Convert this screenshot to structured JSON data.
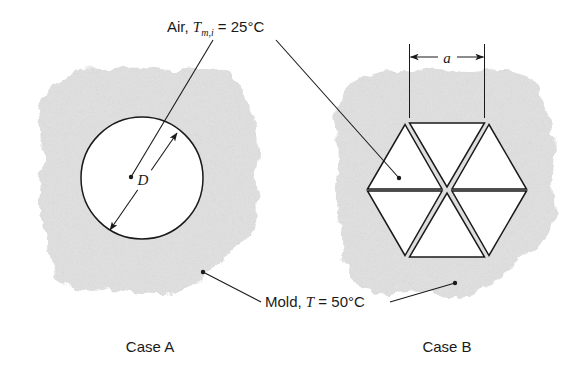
{
  "figure": {
    "title_labels": {
      "air_prefix": "Air, ",
      "air_symbol": "T",
      "air_subscript": "m,i",
      "air_value": " = 25°C",
      "air_full": "Air, T_{m,i} = 25°C",
      "mold_prefix": "Mold, ",
      "mold_symbol": "T",
      "mold_value": " = 50°C",
      "mold_full": "Mold, T = 50°C"
    },
    "captions": {
      "case_a": "Case A",
      "case_b": "Case B"
    },
    "dimensions": {
      "diameter_label": "D",
      "side_label": "a"
    },
    "colors": {
      "mold_fill": "#d2d2d2",
      "line": "#1a1a1a",
      "duct_fill": "#ffffff",
      "page_background": "#ffffff"
    },
    "case_a": {
      "name": "Case A",
      "duct_shape": "circle",
      "duct_count": 1,
      "dimension_symbol": "D"
    },
    "case_b": {
      "name": "Case B",
      "duct_shape": "triangle",
      "duct_count": 6,
      "arrangement": "hexagon",
      "dimension_symbol": "a"
    }
  }
}
